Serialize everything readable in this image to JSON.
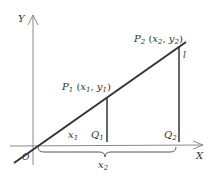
{
  "diagram": {
    "type": "coordinate-geometry",
    "axes": {
      "x_label": "X",
      "y_label": "Y",
      "origin_label": "O"
    },
    "line_label": "l",
    "points": [
      {
        "name": "P1",
        "sub": "1",
        "coords_text": "(x₁, y₁)"
      },
      {
        "name": "P2",
        "sub": "2",
        "coords_text": "(x₂, y₂)"
      }
    ],
    "feet": [
      {
        "name": "Q",
        "sub": "1"
      },
      {
        "name": "Q",
        "sub": "2"
      }
    ],
    "segment_labels": {
      "x1": "x",
      "x1_sub": "1",
      "x2": "x",
      "x2_sub": "2"
    },
    "colors": {
      "line": "#333333",
      "axis": "#888888",
      "text": "#333333"
    }
  }
}
